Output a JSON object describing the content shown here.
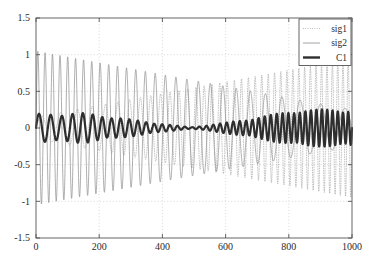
{
  "chart_data": {
    "type": "line",
    "title": "",
    "xlabel": "",
    "ylabel": "",
    "xlim": [
      0,
      1000
    ],
    "ylim": [
      -1.5,
      1.5
    ],
    "grid": true,
    "background": "#ffffff",
    "legend_position": "top-right",
    "xticks": [
      0,
      200,
      400,
      600,
      800,
      1000
    ],
    "xtick_labels": [
      "0",
      "200",
      "400",
      "600",
      "800",
      "1000"
    ],
    "yticks": [
      -1.5,
      -1,
      -0.5,
      0,
      0.5,
      1,
      1.5
    ],
    "ytick_labels": [
      "-1.5",
      "-1",
      "-0.5",
      "0",
      "0.5",
      "1",
      "1.5"
    ],
    "series": [
      {
        "name": "sig1",
        "style": "dotted",
        "color": "#9a9a9a",
        "linewidth": 0.6,
        "description": "Up-chirp: frequency rises left-to-right, envelope grows from about 0.15 to 0.95",
        "envelope_start": 0.15,
        "envelope_end": 0.95,
        "freq_start_cycles_per_1000": 14,
        "freq_end_cycles_per_1000": 62
      },
      {
        "name": "sig2",
        "style": "solid",
        "color": "#8c8c8c",
        "linewidth": 0.7,
        "description": "Down-chirp: frequency falls left-to-right, envelope decays from about 1.05 to 0.25",
        "envelope_start": 1.05,
        "envelope_end": 0.25,
        "freq_start_cycles_per_1000": 44,
        "freq_end_cycles_per_1000": 11
      },
      {
        "name": "C1",
        "style": "solid",
        "color": "#2e2e2e",
        "linewidth": 2.2,
        "description": "Thick low-amplitude beat waveform with an amplitude node near x = 490 and frequency rising toward the right",
        "envelope_min": 0.01,
        "envelope_max": 0.22,
        "node_x": 490
      }
    ],
    "legend_entries": [
      {
        "label": "sig1",
        "style": "dotted",
        "color": "#9a9a9a"
      },
      {
        "label": "sig2",
        "style": "solid",
        "color": "#8c8c8c"
      },
      {
        "label": "C1",
        "style": "solid",
        "color": "#2e2e2e"
      }
    ],
    "axis_color": "#555555",
    "grid_color": "#c8c8c8"
  }
}
